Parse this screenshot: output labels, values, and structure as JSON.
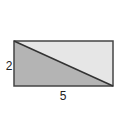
{
  "diagram": {
    "shape": "rectangle divided by diagonal",
    "labels": {
      "height": "2",
      "width": "5"
    },
    "colors": {
      "shaded_triangle": "#b4b4b4",
      "light_triangle": "#e6e6e6",
      "stroke": "#333333"
    }
  }
}
